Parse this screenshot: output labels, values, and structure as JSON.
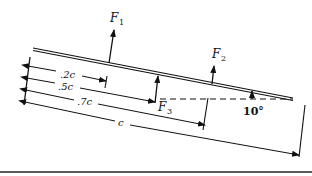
{
  "diagram": {
    "type": "inclined plate with forces",
    "forces": [
      {
        "id": "F1",
        "label": "F",
        "subscript": "1",
        "position": ".2c"
      },
      {
        "id": "F3",
        "label": "F",
        "subscript": "3",
        "position": ".5c"
      },
      {
        "id": "F2",
        "label": "F",
        "subscript": "2",
        "position": ".7c"
      }
    ],
    "dimensions": [
      {
        "label": ".2c"
      },
      {
        "label": ".5c"
      },
      {
        "label": ".7c"
      },
      {
        "label": "c"
      }
    ],
    "angle": {
      "label": "10°"
    },
    "colors": {
      "ink": "#111111",
      "background": "#ffffff"
    }
  }
}
